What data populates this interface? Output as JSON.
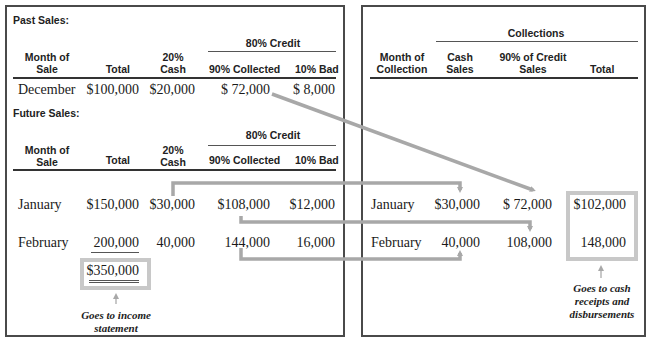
{
  "past_sales": {
    "title": "Past Sales:",
    "group_header": "80% Credit",
    "headers": {
      "month": "Month of\nSale",
      "month_line1": "Month of",
      "month_line2": "Sale",
      "total": "Total",
      "cash_line1": "20%",
      "cash_line2": "Cash",
      "collected": "90% Collected",
      "bad": "10% Bad"
    },
    "rows": [
      {
        "month": "December",
        "total": "$100,000",
        "cash": "$20,000",
        "collected": "$ 72,000",
        "bad": "$ 8,000"
      }
    ]
  },
  "future_sales": {
    "title": "Future Sales:",
    "group_header": "80% Credit",
    "headers": {
      "month_line1": "Month of",
      "month_line2": "Sale",
      "total": "Total",
      "cash_line1": "20%",
      "cash_line2": "Cash",
      "collected": "90% Collected",
      "bad": "10% Bad"
    },
    "rows": [
      {
        "month": "January",
        "total": "$150,000",
        "cash": "$30,000",
        "collected": "$108,000",
        "bad": "$12,000"
      },
      {
        "month": "February",
        "total": "200,000",
        "cash": "40,000",
        "collected": "144,000",
        "bad": "16,000"
      }
    ],
    "sum_total": "$350,000",
    "note_line1": "Goes to income",
    "note_line2": "statement"
  },
  "collections": {
    "group_header": "Collections",
    "headers": {
      "month_line1": "Month of",
      "month_line2": "Collection",
      "cash_line1": "Cash",
      "cash_line2": "Sales",
      "credit_line1": "90% of Credit",
      "credit_line2": "Sales",
      "total": "Total"
    },
    "rows": [
      {
        "month": "January",
        "cash": "$30,000",
        "credit": "$ 72,000",
        "total": "$102,000"
      },
      {
        "month": "February",
        "cash": "40,000",
        "credit": "108,000",
        "total": "148,000"
      }
    ],
    "note_line1": "Goes to cash",
    "note_line2": "receipts and",
    "note_line3": "disbursements"
  },
  "colors": {
    "border": "#4a4a4a",
    "arrow": "#a8a8a8",
    "highlight_box": "#c8c8c8"
  }
}
